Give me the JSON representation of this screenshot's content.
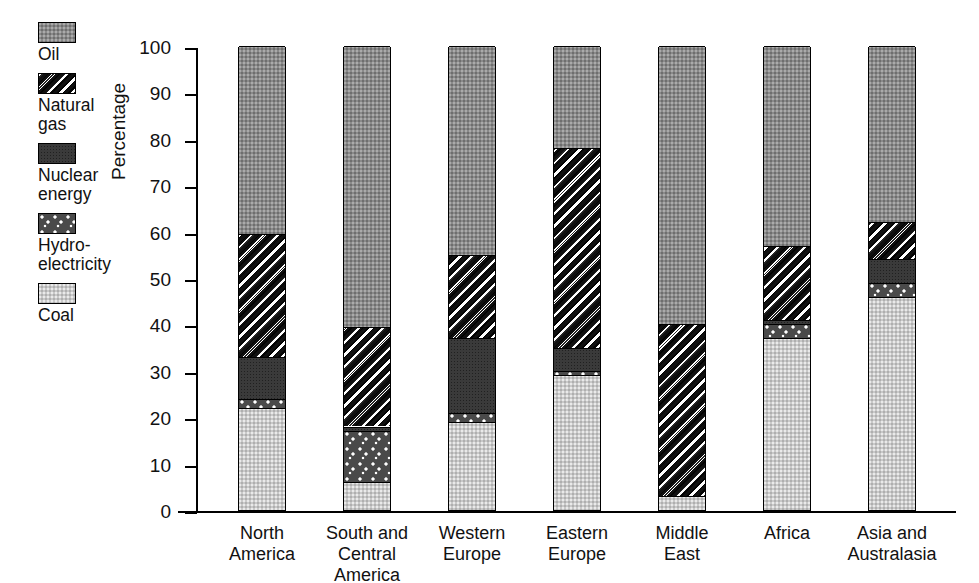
{
  "chart_data": {
    "type": "bar",
    "subtype": "stacked-bar-100",
    "title": "",
    "xlabel": "",
    "ylabel": "Percentage",
    "ylim": [
      0,
      100
    ],
    "yticks": [
      0,
      10,
      20,
      30,
      40,
      50,
      60,
      70,
      80,
      90,
      100
    ],
    "grid": false,
    "legend_position": "left-outside",
    "categories": [
      "North\nAmerica",
      "South and\nCentral\nAmerica",
      "Western\nEurope",
      "Eastern\nEurope",
      "Middle\nEast",
      "Africa",
      "Asia and\nAustralasia"
    ],
    "series": [
      {
        "name": "Coal",
        "key": "coal",
        "swatch": "sw-coal",
        "values": [
          22,
          6,
          19,
          29,
          3,
          37,
          46
        ]
      },
      {
        "name": "Hydro-\nelectricity",
        "key": "hydro",
        "swatch": "sw-hydro",
        "values": [
          2,
          11,
          2,
          1,
          0,
          3,
          3
        ]
      },
      {
        "name": "Nuclear\nenergy",
        "key": "nuclear",
        "swatch": "sw-nuclear",
        "values": [
          9,
          1,
          16,
          5,
          0,
          1,
          5
        ]
      },
      {
        "name": "Natural\ngas",
        "key": "gas",
        "swatch": "sw-gas",
        "values": [
          26.5,
          21.5,
          18,
          43,
          37,
          16,
          8
        ]
      },
      {
        "name": "Oil",
        "key": "oil",
        "swatch": "sw-oil",
        "values": [
          40.5,
          60.5,
          45,
          22,
          60,
          43,
          38
        ]
      }
    ],
    "stack_order_bottom_to_top": [
      "coal",
      "hydro",
      "nuclear",
      "gas",
      "oil"
    ]
  },
  "legend": {
    "items": [
      {
        "label": "Oil",
        "swatch": "sw-oil",
        "icon": "legend-swatch-oil"
      },
      {
        "label": "Natural\ngas",
        "swatch": "sw-gas",
        "icon": "legend-swatch-natural-gas"
      },
      {
        "label": "Nuclear\nenergy",
        "swatch": "sw-nuclear",
        "icon": "legend-swatch-nuclear-energy"
      },
      {
        "label": "Hydro-\nelectricity",
        "swatch": "sw-hydro",
        "icon": "legend-swatch-hydroelectricity"
      },
      {
        "label": "Coal",
        "swatch": "sw-coal",
        "icon": "legend-swatch-coal"
      }
    ]
  },
  "axis": {
    "y_title": "Percentage",
    "y_tick_labels": [
      "100",
      "90",
      "80",
      "70",
      "60",
      "50",
      "40",
      "30",
      "20",
      "10",
      "0"
    ]
  },
  "colors": {
    "oil": "#8a8a8a",
    "natural_gas": "#101010",
    "nuclear_energy": "#3a3a3a",
    "hydroelectricity": "#4a4a4a",
    "coal": "#c9c9c9",
    "axis": "#000000",
    "background": "#ffffff"
  }
}
